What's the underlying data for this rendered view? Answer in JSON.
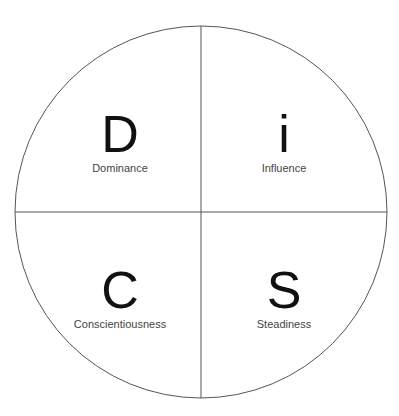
{
  "diagram": {
    "quadrants": [
      {
        "letter": "D",
        "label": "Dominance"
      },
      {
        "letter": "i",
        "label": "Influence"
      },
      {
        "letter": "C",
        "label": "Conscientiousness"
      },
      {
        "letter": "S",
        "label": "Steadiness"
      }
    ],
    "colors": {
      "line": "#555555",
      "text": "#111111",
      "label": "#444444"
    }
  }
}
